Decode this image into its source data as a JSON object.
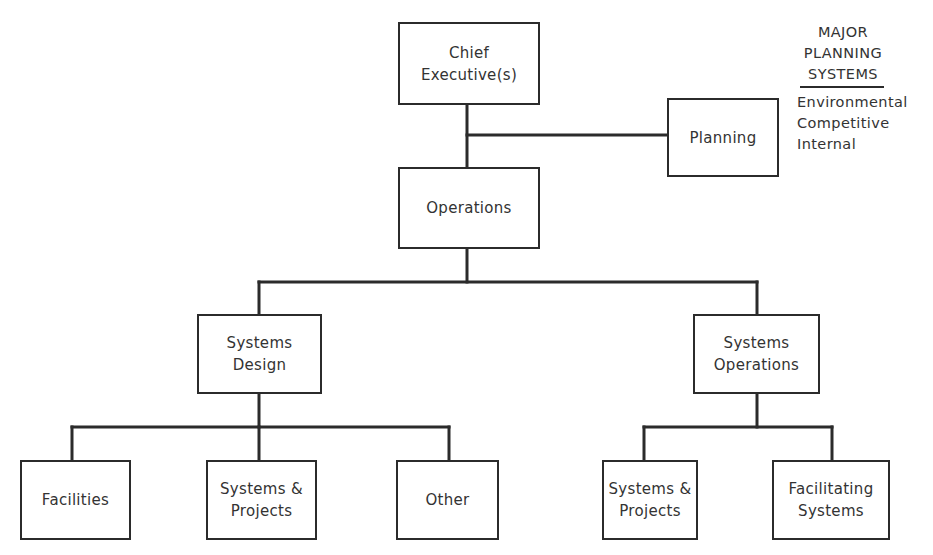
{
  "diagram": {
    "type": "org-chart",
    "nodes": {
      "chief": {
        "lines": [
          "Chief",
          "Executive(s)"
        ]
      },
      "planning": {
        "lines": [
          "Planning"
        ]
      },
      "operations": {
        "lines": [
          "Operations"
        ]
      },
      "systems_design": {
        "lines": [
          "Systems",
          "Design"
        ]
      },
      "systems_operations": {
        "lines": [
          "Systems",
          "Operations"
        ]
      },
      "facilities": {
        "lines": [
          "Facilities"
        ]
      },
      "sd_systems_projects": {
        "lines": [
          "Systems &",
          "Projects"
        ]
      },
      "other": {
        "lines": [
          "Other"
        ]
      },
      "so_systems_projects": {
        "lines": [
          "Systems &",
          "Projects"
        ]
      },
      "facilitating_systems": {
        "lines": [
          "Facilitating",
          "Systems"
        ]
      }
    },
    "edges": [
      [
        "chief",
        "operations"
      ],
      [
        "chief",
        "planning"
      ],
      [
        "operations",
        "systems_design"
      ],
      [
        "operations",
        "systems_operations"
      ],
      [
        "systems_design",
        "facilities"
      ],
      [
        "systems_design",
        "sd_systems_projects"
      ],
      [
        "systems_design",
        "other"
      ],
      [
        "systems_operations",
        "so_systems_projects"
      ],
      [
        "systems_operations",
        "facilitating_systems"
      ]
    ]
  },
  "legend": {
    "title_lines": [
      "MAJOR",
      "PLANNING",
      "SYSTEMS"
    ],
    "items": [
      "Environmental",
      "Competitive",
      "Internal"
    ]
  },
  "colors": {
    "line": "#2b2b2b",
    "text": "#333333",
    "background": "#ffffff"
  }
}
